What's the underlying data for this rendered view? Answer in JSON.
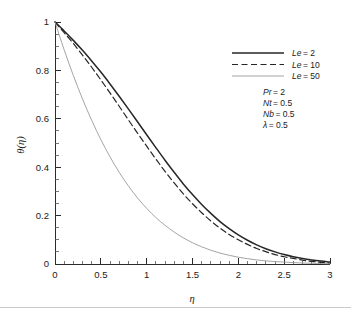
{
  "chart_data": {
    "type": "line",
    "title": "",
    "xlabel": "η",
    "ylabel": "θ(η)",
    "xlim": [
      0,
      3
    ],
    "ylim": [
      0,
      1
    ],
    "xticks": [
      "0",
      "0.5",
      "1",
      "1.5",
      "2",
      "2.5",
      "3"
    ],
    "xtick_values": [
      0,
      0.5,
      1,
      1.5,
      2,
      2.5,
      3
    ],
    "yticks": [
      "0",
      "0.2",
      "0.4",
      "0.6",
      "0.8",
      "1"
    ],
    "ytick_values": [
      0,
      0.2,
      0.4,
      0.6,
      0.8,
      1
    ],
    "grid": false,
    "legend_position": "upper right",
    "minor_ticks": true,
    "x": [
      0,
      0.1,
      0.2,
      0.3,
      0.4,
      0.5,
      0.6,
      0.7,
      0.8,
      0.9,
      1.0,
      1.1,
      1.2,
      1.3,
      1.4,
      1.5,
      1.6,
      1.7,
      1.8,
      1.9,
      2.0,
      2.1,
      2.2,
      2.3,
      2.4,
      2.5,
      2.6,
      2.7,
      2.8,
      2.9,
      3.0
    ],
    "series": [
      {
        "name": "Le = 2",
        "style": "solid",
        "color": "#262626",
        "width": 1.5,
        "values": [
          1.0,
          0.963,
          0.924,
          0.883,
          0.839,
          0.793,
          0.744,
          0.693,
          0.641,
          0.588,
          0.534,
          0.481,
          0.429,
          0.379,
          0.331,
          0.287,
          0.246,
          0.209,
          0.175,
          0.146,
          0.12,
          0.098,
          0.079,
          0.063,
          0.05,
          0.039,
          0.03,
          0.023,
          0.017,
          0.012,
          0.008
        ]
      },
      {
        "name": "Le = 10",
        "style": "dashed",
        "color": "#262626",
        "width": 1.2,
        "values": [
          1.0,
          0.956,
          0.911,
          0.863,
          0.813,
          0.761,
          0.707,
          0.652,
          0.596,
          0.541,
          0.487,
          0.434,
          0.383,
          0.335,
          0.29,
          0.249,
          0.212,
          0.178,
          0.148,
          0.122,
          0.1,
          0.081,
          0.064,
          0.051,
          0.039,
          0.03,
          0.023,
          0.016,
          0.011,
          0.007,
          0.003
        ]
      },
      {
        "name": "Le = 50",
        "style": "solid",
        "color": "#9a9a9a",
        "width": 0.9,
        "values": [
          1.0,
          0.885,
          0.779,
          0.682,
          0.594,
          0.514,
          0.443,
          0.379,
          0.323,
          0.273,
          0.23,
          0.192,
          0.16,
          0.132,
          0.108,
          0.088,
          0.071,
          0.057,
          0.045,
          0.036,
          0.028,
          0.022,
          0.017,
          0.013,
          0.01,
          0.008,
          0.006,
          0.004,
          0.003,
          0.002,
          0.001
        ]
      }
    ]
  },
  "legend": {
    "entries": [
      {
        "label": "Le = 2",
        "symbol": "Le",
        "value": "= 2"
      },
      {
        "label": "Le = 10",
        "symbol": "Le",
        "value": "= 10"
      },
      {
        "label": "Le = 50",
        "symbol": "Le",
        "value": "= 50"
      }
    ]
  },
  "parameters": {
    "lines": [
      {
        "symbol": "Pr",
        "value": "= 2"
      },
      {
        "symbol": "Nt",
        "value": "= 0.5"
      },
      {
        "symbol": "Nb",
        "value": "= 0.5"
      },
      {
        "symbol": "λ",
        "value": "= 0.5"
      }
    ]
  },
  "axes": {
    "x_label": "η",
    "y_label": "θ(η)",
    "x_ticks": [
      "0",
      "0.5",
      "1",
      "1.5",
      "2",
      "2.5",
      "3"
    ],
    "y_ticks": [
      "0",
      "0.2",
      "0.4",
      "0.6",
      "0.8",
      "1"
    ]
  }
}
